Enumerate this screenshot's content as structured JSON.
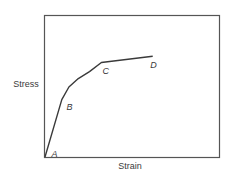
{
  "chart_data": {
    "type": "line",
    "title": "",
    "xlabel": "Strain",
    "ylabel": "Stress",
    "xlim": [
      0,
      10
    ],
    "ylim": [
      0,
      10
    ],
    "grid": false,
    "legend": "none",
    "series": [
      {
        "name": "stress-strain curve",
        "points": [
          {
            "x": 0.0,
            "y": 0.0
          },
          {
            "x": 0.98,
            "y": 4.1
          },
          {
            "x": 1.4,
            "y": 5.0
          },
          {
            "x": 1.95,
            "y": 5.6
          },
          {
            "x": 2.6,
            "y": 6.1
          },
          {
            "x": 3.3,
            "y": 6.75
          },
          {
            "x": 6.3,
            "y": 7.2
          }
        ]
      }
    ],
    "annotations": [
      {
        "label": "A",
        "x": 0.0,
        "y": 0.0,
        "dx": 0.55,
        "dy": 0.2
      },
      {
        "label": "B",
        "x": 0.98,
        "y": 4.1,
        "dx": 0.45,
        "dy": -0.55
      },
      {
        "label": "C",
        "x": 3.3,
        "y": 6.75,
        "dx": 0.25,
        "dy": -0.6
      },
      {
        "label": "D",
        "x": 6.3,
        "y": 7.2,
        "dx": 0.05,
        "dy": -0.6
      }
    ]
  }
}
